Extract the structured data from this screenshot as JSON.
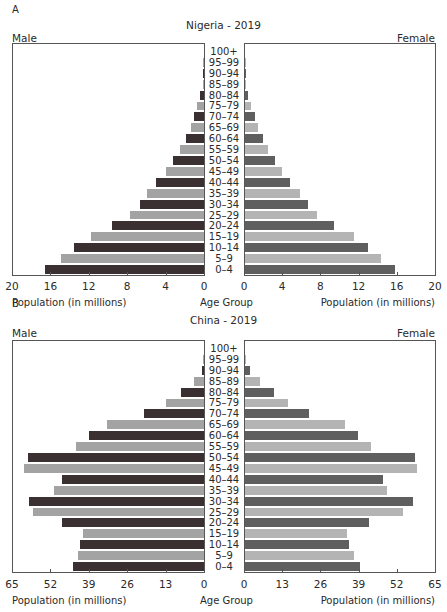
{
  "panels": [
    {
      "letter": "A",
      "title": "Nigeria - 2019",
      "male_label": "Male",
      "female_label": "Female",
      "x_axis_title_left": "Population (in millions)",
      "x_axis_title_center": "Age Group",
      "x_axis_title_right": "Population (in millions)",
      "max": 20,
      "ticks": [
        "20",
        "16",
        "12",
        "8",
        "4",
        "0"
      ],
      "ticks_right": [
        "0",
        "4",
        "8",
        "12",
        "16",
        "20"
      ]
    },
    {
      "letter": "B",
      "title": "China - 2019",
      "male_label": "Male",
      "female_label": "Female",
      "x_axis_title_left": "Population (in millions)",
      "x_axis_title_center": "Age Group",
      "x_axis_title_right": "Population (in millions)",
      "max": 65,
      "ticks": [
        "65",
        "52",
        "39",
        "26",
        "13",
        "0"
      ],
      "ticks_right": [
        "0",
        "13",
        "26",
        "39",
        "52",
        "65"
      ]
    }
  ],
  "colors": {
    "male_dark": "#3b3031",
    "male_light": "#a3a3a3",
    "female_dark": "#5f5f5f",
    "female_light": "#b4b4b4",
    "axis": "#555555"
  },
  "chart_data": [
    {
      "type": "bar",
      "subtype": "population-pyramid",
      "title": "Nigeria - 2019",
      "panel": "A",
      "categories": [
        "100+",
        "95-99",
        "90-94",
        "85-89",
        "80-84",
        "75-79",
        "70-74",
        "65-69",
        "60-64",
        "55-59",
        "50-54",
        "45-49",
        "40-44",
        "35-39",
        "30-34",
        "25-29",
        "20-24",
        "15-19",
        "10-14",
        "5-9",
        "0-4"
      ],
      "series": [
        {
          "name": "Male",
          "values": [
            0.0,
            0.02,
            0.05,
            0.1,
            0.4,
            0.7,
            1.0,
            1.4,
            1.9,
            2.5,
            3.2,
            4.0,
            5.0,
            5.9,
            6.7,
            7.7,
            9.6,
            11.8,
            13.5,
            14.9,
            16.6
          ]
        },
        {
          "name": "Female",
          "values": [
            0.0,
            0.02,
            0.05,
            0.1,
            0.3,
            0.6,
            1.0,
            1.4,
            1.9,
            2.4,
            3.1,
            3.9,
            4.7,
            5.8,
            6.6,
            7.5,
            9.3,
            11.4,
            12.9,
            14.2,
            15.7
          ]
        }
      ],
      "xlabel": "Population (in millions)",
      "ylabel": "Age Group",
      "xlim": [
        0,
        20
      ],
      "xticks": [
        0,
        4,
        8,
        12,
        16,
        20
      ],
      "legend": [
        "Male (left)",
        "Female (right)"
      ],
      "grid": false
    },
    {
      "type": "bar",
      "subtype": "population-pyramid",
      "title": "China - 2019",
      "panel": "B",
      "categories": [
        "100+",
        "95-99",
        "90-94",
        "85-89",
        "80-84",
        "75-79",
        "70-74",
        "65-69",
        "60-64",
        "55-59",
        "50-54",
        "45-49",
        "40-44",
        "35-39",
        "30-34",
        "25-29",
        "20-24",
        "15-19",
        "10-14",
        "5-9",
        "0-4"
      ],
      "series": [
        {
          "name": "Male",
          "values": [
            0.0,
            0.1,
            0.7,
            3.4,
            7.8,
            12.9,
            20.3,
            32.8,
            38.9,
            43.3,
            59.6,
            60.9,
            48.0,
            50.8,
            59.2,
            57.9,
            48.0,
            41.0,
            42.0,
            42.7,
            44.3
          ]
        },
        {
          "name": "Female",
          "values": [
            0.0,
            0.2,
            1.7,
            5.1,
            9.9,
            14.6,
            21.8,
            34.0,
            38.5,
            42.9,
            57.9,
            58.5,
            47.0,
            48.3,
            57.2,
            53.8,
            42.2,
            34.7,
            35.4,
            37.1,
            39.1
          ]
        }
      ],
      "xlabel": "Population (in millions)",
      "ylabel": "Age Group",
      "xlim": [
        0,
        65
      ],
      "xticks": [
        0,
        13,
        26,
        39,
        52,
        65
      ],
      "legend": [
        "Male (left)",
        "Female (right)"
      ],
      "grid": false
    }
  ]
}
